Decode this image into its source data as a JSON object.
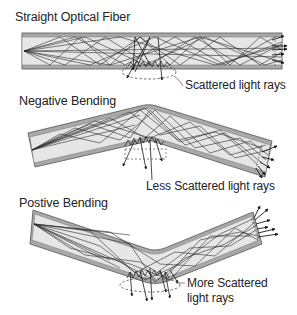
{
  "figure": {
    "panels": [
      {
        "title": "Straight Optical Fiber",
        "annotation": "Scattered light rays"
      },
      {
        "title": "Negative Bending",
        "annotation": "Less Scattered light rays"
      },
      {
        "title": "Postive Bending",
        "annotation_line1": "More Scattered",
        "annotation_line2": "light rays"
      }
    ],
    "colors": {
      "cladding": "#9a9a9a",
      "core": "#e4e4e4",
      "rays": "#2a2a2a",
      "scatter": "#1a1a1a"
    }
  }
}
